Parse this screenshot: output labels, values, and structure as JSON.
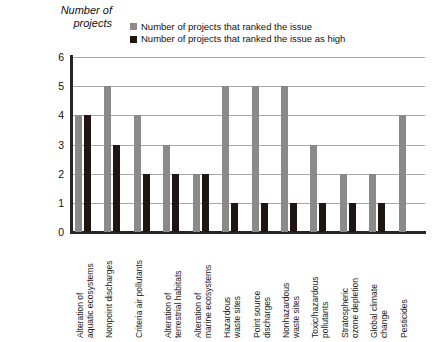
{
  "chart_data": {
    "type": "bar",
    "title": "",
    "ylabel": "Number of\nprojects",
    "xlabel": "",
    "ylim": [
      0,
      6
    ],
    "yticks": [
      6,
      5,
      4,
      3,
      2,
      1,
      0
    ],
    "grid": true,
    "legend_position": "top-center",
    "categories": [
      "Alteration of\naquatic ecosystems",
      "Nonpoint discharges",
      "Criteria air pollutants",
      "Alteration of\nterrestrial habitats",
      "Alteration of\nmarine ecosystems",
      "Hazardous\nwaste sites",
      "Point source\ndischarges",
      "Nonhazardous\nwaste sites",
      "Toxic/hazardous\npollutants",
      "Stratospheric\nozone depletion",
      "Global climate\nchange",
      "Pesticides"
    ],
    "series": [
      {
        "name": "Number of projects that ranked the issue",
        "color": "#8a8a8a",
        "values": [
          4,
          5,
          4,
          3,
          2,
          5,
          5,
          5,
          3,
          2,
          2,
          4
        ]
      },
      {
        "name": "Number of projects that ranked the issue as high",
        "color": "#1f1512",
        "values": [
          4,
          3,
          2,
          2,
          2,
          1,
          1,
          1,
          1,
          1,
          1,
          null
        ]
      }
    ]
  },
  "colors": {
    "series_light": "#8a8a8a",
    "series_dark": "#1f1512",
    "axis": "#262626",
    "gridline": "#a8a8a8",
    "background": "#ffffff"
  }
}
